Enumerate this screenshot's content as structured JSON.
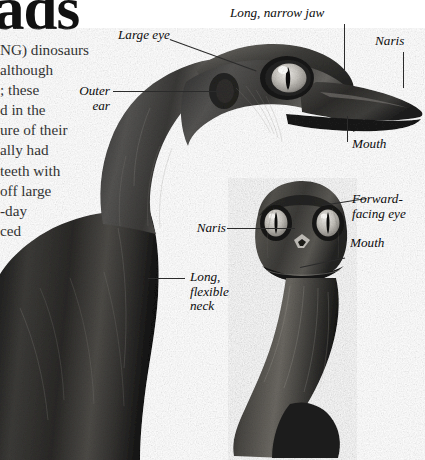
{
  "document": {
    "headline": "ads",
    "page_background": "#ffffff",
    "ink_color": "#111111",
    "leader_color": "#2b2b2b"
  },
  "body_text": {
    "lines": [
      "NG) dinosaurs",
      "although",
      "; these",
      "d in the",
      "ure of their",
      "ally had",
      "teeth with",
      "off large",
      "-day",
      "ced"
    ]
  },
  "figures": [
    {
      "name": "lateral-head-specimen",
      "view": "lateral",
      "description": "Dark grayscale model head and long curved neck of a troodontid-like dinosaur seen from the side"
    },
    {
      "name": "frontal-head-specimen",
      "view": "frontal",
      "description": "Dark grayscale model head seen from the front on a long flexible neck"
    }
  ],
  "callouts": [
    {
      "id": "large-eye",
      "text": "Large eye",
      "figure": "lateral-head-specimen"
    },
    {
      "id": "long-narrow-jaw",
      "text": "Long, narrow jaw",
      "figure": "lateral-head-specimen"
    },
    {
      "id": "naris-lateral",
      "text": "Naris",
      "figure": "lateral-head-specimen"
    },
    {
      "id": "outer-ear",
      "text": "Outer\near",
      "figure": "lateral-head-specimen"
    },
    {
      "id": "mouth-lateral",
      "text": "Mouth",
      "figure": "lateral-head-specimen"
    },
    {
      "id": "long-flexible-neck",
      "text": "Long,\nflexible\nneck",
      "figure": "lateral-head-specimen"
    },
    {
      "id": "naris-frontal",
      "text": "Naris",
      "figure": "frontal-head-specimen"
    },
    {
      "id": "forward-facing-eye",
      "text": "Forward-\nfacing eye",
      "figure": "frontal-head-specimen"
    },
    {
      "id": "mouth-frontal",
      "text": "Mouth",
      "figure": "frontal-head-specimen"
    }
  ]
}
